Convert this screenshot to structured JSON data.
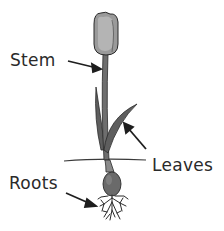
{
  "diagram": {
    "labels": {
      "stem": "Stem",
      "leaves": "Leaves",
      "roots": "Roots"
    },
    "colors": {
      "background": "#ffffff",
      "ink": "#2a2a2a",
      "flower_fill": "#9a9a9a",
      "stem_fill": "#6e6e6e",
      "leaf_fill": "#5e5e5e",
      "bulb_fill": "#6a6a6a",
      "ground_line": "#3a3a3a"
    }
  }
}
